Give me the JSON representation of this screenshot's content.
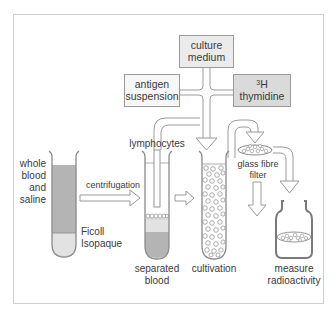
{
  "diagram": {
    "colors": {
      "frame": "#cfcfcf",
      "outline": "#8a8a8a",
      "box_light_fill": "#ebebeb",
      "box_white_fill": "#f7f7f7",
      "box_dark_fill": "#dadada",
      "blood_fill": "#b4b4b4",
      "ficoll_fill": "#e2e2e2",
      "text": "#3a3a3a"
    },
    "inputs": {
      "culture_medium": {
        "line1": "culture",
        "line2": "medium"
      },
      "antigen_suspension": {
        "line1": "antigen",
        "line2": "suspension"
      },
      "thymidine": {
        "superscript": "3",
        "line1": "H",
        "line2": "thymidine"
      }
    },
    "labels": {
      "whole_blood": [
        "whole",
        "blood",
        "and",
        "saline"
      ],
      "centrifugation": "centrifugation",
      "ficoll": [
        "Ficoll",
        "Isopaque"
      ],
      "lymphocytes": "lymphocytes",
      "separated_blood": [
        "separated",
        "blood"
      ],
      "cultivation": "cultivation",
      "glass_fibre_filter": [
        "glass fibre",
        "filter"
      ],
      "measure_radioactivity": [
        "measure",
        "radioactivity"
      ]
    },
    "steps": [
      {
        "id": "whole-blood-tube",
        "label": "whole blood and saline over Ficoll Isopaque"
      },
      {
        "id": "separated-blood-tube",
        "label": "separated blood"
      },
      {
        "id": "cultivation-tube",
        "label": "cultivation"
      },
      {
        "id": "filter",
        "label": "glass fibre filter"
      },
      {
        "id": "counter-vial",
        "label": "measure radioactivity"
      }
    ]
  }
}
